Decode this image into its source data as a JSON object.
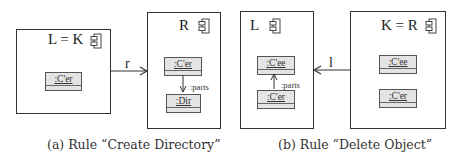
{
  "diagrams": [
    {
      "caption": "(a) Rule “Create Directory”",
      "left_box": {
        "title": "L = K",
        "icon": "component-icon",
        "objects": [
          ":C'er"
        ]
      },
      "right_box": {
        "title": "R",
        "icon": "component-icon",
        "objects": [
          ":C'er",
          ":Dir"
        ],
        "edge_label": ":parts"
      },
      "arrow": {
        "label": "r",
        "direction": "left-to-right"
      }
    },
    {
      "caption": "(b) Rule “Delete Object”",
      "left_box": {
        "title": "L",
        "icon": "component-icon",
        "objects": [
          ":C'ee",
          ":C'er"
        ],
        "edge_label": ":parts"
      },
      "right_box": {
        "title": "K = R",
        "icon": "component-icon",
        "objects": [
          ":C'ee",
          ":C'er"
        ]
      },
      "arrow": {
        "label": "l",
        "direction": "right-to-left"
      }
    }
  ]
}
